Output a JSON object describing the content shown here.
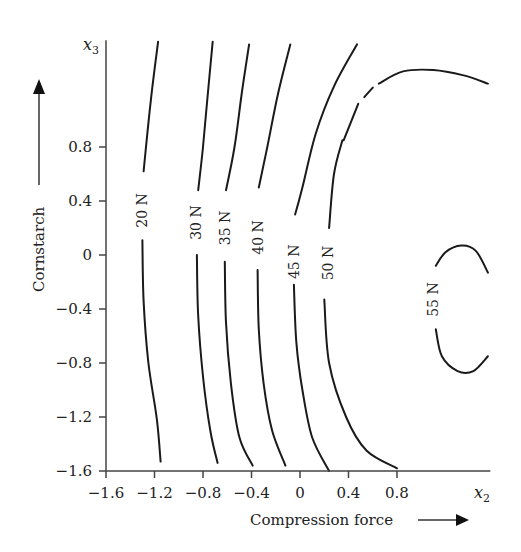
{
  "chart_data": {
    "type": "contour",
    "title": "",
    "xlabel": "Compression force",
    "ylabel": "Cornstarch",
    "x_variable": {
      "symbol": "x",
      "subscript": "2"
    },
    "y_variable": {
      "symbol": "x",
      "subscript": "3"
    },
    "xlim": [
      -1.6,
      1.57
    ],
    "ylim": [
      -1.6,
      1.59
    ],
    "x_ticks": [
      -1.6,
      -1.2,
      -0.8,
      -0.4,
      0,
      0.4,
      0.8
    ],
    "x_tick_labels": [
      "−1.6",
      "−1.2",
      "−0.8",
      "−0.4",
      "0",
      "0.4",
      "0.8"
    ],
    "y_ticks": [
      -1.6,
      -1.2,
      -0.8,
      -0.4,
      0,
      0.4,
      0.8
    ],
    "y_tick_labels": [
      "−1.6",
      "−1.2",
      "−0.8",
      "−0.4",
      "0",
      "0.4",
      "0.8"
    ],
    "grid": false,
    "legend": "none",
    "contours": [
      {
        "level": "20 N",
        "label_at": [
          -1.3,
          0.33
        ],
        "segments": [
          [
            [
              -1.17,
              1.58
            ],
            [
              -1.23,
              1.15
            ],
            [
              -1.29,
              0.62
            ]
          ],
          [
            [
              -1.3,
              0.11
            ],
            [
              -1.29,
              -0.34
            ],
            [
              -1.25,
              -0.8
            ],
            [
              -1.18,
              -1.22
            ],
            [
              -1.15,
              -1.53
            ]
          ]
        ]
      },
      {
        "level": "30 N",
        "label_at": [
          -0.86,
          0.24
        ],
        "segments": [
          [
            [
              -0.72,
              1.58
            ],
            [
              -0.76,
              1.2
            ],
            [
              -0.8,
              0.8
            ],
            [
              -0.84,
              0.48
            ]
          ],
          [
            [
              -0.85,
              0.0
            ],
            [
              -0.84,
              -0.45
            ],
            [
              -0.8,
              -0.9
            ],
            [
              -0.74,
              -1.3
            ],
            [
              -0.68,
              -1.54
            ]
          ]
        ]
      },
      {
        "level": "35 N",
        "label_at": [
          -0.62,
          0.2
        ],
        "segments": [
          [
            [
              -0.42,
              1.56
            ],
            [
              -0.48,
              1.2
            ],
            [
              -0.54,
              0.8
            ],
            [
              -0.61,
              0.48
            ]
          ],
          [
            [
              -0.62,
              -0.05
            ],
            [
              -0.61,
              -0.5
            ],
            [
              -0.57,
              -0.95
            ],
            [
              -0.5,
              -1.35
            ],
            [
              -0.39,
              -1.56
            ]
          ]
        ]
      },
      {
        "level": "40 N",
        "label_at": [
          -0.35,
          0.13
        ],
        "segments": [
          [
            [
              -0.08,
              1.56
            ],
            [
              -0.18,
              1.2
            ],
            [
              -0.27,
              0.8
            ],
            [
              -0.34,
              0.5
            ]
          ],
          [
            [
              -0.35,
              -0.11
            ],
            [
              -0.34,
              -0.55
            ],
            [
              -0.3,
              -0.95
            ],
            [
              -0.23,
              -1.3
            ],
            [
              -0.12,
              -1.56
            ]
          ]
        ]
      },
      {
        "level": "45 N",
        "label_at": [
          -0.05,
          -0.05
        ],
        "segments": [
          [
            [
              0.47,
              1.56
            ],
            [
              0.28,
              1.25
            ],
            [
              0.13,
              0.9
            ],
            [
              0.02,
              0.5
            ],
            [
              -0.04,
              0.3
            ]
          ],
          [
            [
              -0.05,
              -0.22
            ],
            [
              -0.03,
              -0.65
            ],
            [
              0.02,
              -1.0
            ],
            [
              0.1,
              -1.35
            ],
            [
              0.24,
              -1.6
            ]
          ]
        ]
      },
      {
        "level": "50 N",
        "label_at": [
          0.23,
          -0.06
        ],
        "segments": [
          [
            [
              0.35,
              0.85
            ],
            [
              0.28,
              0.6
            ],
            [
              0.24,
              0.2
            ]
          ],
          [
            [
              0.2,
              -0.33
            ],
            [
              0.24,
              -0.8
            ],
            [
              0.38,
              -1.2
            ],
            [
              0.55,
              -1.45
            ],
            [
              0.8,
              -1.58
            ]
          ],
          [
            [
              0.36,
              0.85
            ],
            [
              0.48,
              1.12
            ]
          ],
          [
            [
              0.53,
              1.17
            ],
            [
              0.6,
              1.24
            ]
          ],
          [
            [
              0.65,
              1.27
            ],
            [
              0.85,
              1.36
            ],
            [
              1.1,
              1.37
            ],
            [
              1.35,
              1.33
            ],
            [
              1.55,
              1.27
            ]
          ]
        ]
      },
      {
        "level": "55 N",
        "label_at": [
          1.1,
          -0.33
        ],
        "segments": [
          [
            [
              1.12,
              -0.08
            ],
            [
              1.2,
              0.02
            ],
            [
              1.33,
              0.07
            ],
            [
              1.45,
              0.03
            ],
            [
              1.55,
              -0.13
            ]
          ],
          [
            [
              1.12,
              -0.55
            ],
            [
              1.17,
              -0.75
            ],
            [
              1.3,
              -0.86
            ],
            [
              1.43,
              -0.86
            ],
            [
              1.55,
              -0.75
            ]
          ]
        ]
      }
    ]
  }
}
